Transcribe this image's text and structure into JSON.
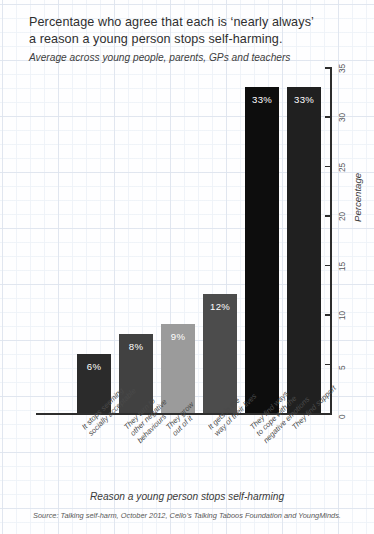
{
  "title": {
    "line1": "Percentage who agree that each is ‘nearly always’",
    "line2": "a reason a young person stops self-harming.",
    "subtitle": "Average across young people, parents, GPs and teachers"
  },
  "axes": {
    "y_title": "Percentage",
    "x_title": "Reason a young person stops self-harming",
    "y_ticks": [
      "0",
      "5",
      "10",
      "15",
      "20",
      "25",
      "30",
      "35"
    ]
  },
  "source": "Source: Talking self-harm, October 2012, Cello’s Talking Taboos Foundation and YoungMinds.",
  "bars": [
    {
      "label_line1": "It stops seeming",
      "label_line2": "socially acceptable",
      "value_label": "6%"
    },
    {
      "label_line1": "They turn to",
      "label_line2": "other negative",
      "label_line3": "behaviours",
      "value_label": "8%"
    },
    {
      "label_line1": "They grow",
      "label_line2": "out of it",
      "value_label": "9%"
    },
    {
      "label_line1": "It gets in the",
      "label_line2": "way of their lives",
      "value_label": "12%"
    },
    {
      "label_line1": "They find ways",
      "label_line2": "to cope with the",
      "label_line3": "negative emotions",
      "value_label": "33%"
    },
    {
      "label_line1": "They find support",
      "label_line2": "",
      "value_label": "33%"
    }
  ],
  "chart_data": {
    "type": "bar",
    "title": "Percentage who agree that each is ‘nearly always’ a reason a young person stops self-harming.",
    "subtitle": "Average across young people, parents, GPs and teachers",
    "xlabel": "Reason a young person stops self-harming",
    "ylabel": "Percentage",
    "ylim": [
      0,
      35
    ],
    "yticks": [
      0,
      5,
      10,
      15,
      20,
      25,
      30,
      35
    ],
    "grid": false,
    "legend": "none",
    "y_axis_position": "right",
    "categories": [
      "It stops seeming socially acceptable",
      "They turn to other negative behaviours",
      "They grow out of it",
      "It gets in the way of their lives",
      "They find ways to cope with the negative emotions",
      "They find support"
    ],
    "values": [
      6,
      8,
      9,
      12,
      33,
      33
    ],
    "data_labels": [
      "6%",
      "8%",
      "9%",
      "12%",
      "33%",
      "33%"
    ],
    "bar_colors": [
      "#2b2b2b",
      "#414141",
      "#9b9b9b",
      "#4c4c4c",
      "#0d0d0d",
      "#202020"
    ],
    "source": "Source: Talking self-harm, October 2012, Cello’s Talking Taboos Foundation and YoungMinds."
  }
}
